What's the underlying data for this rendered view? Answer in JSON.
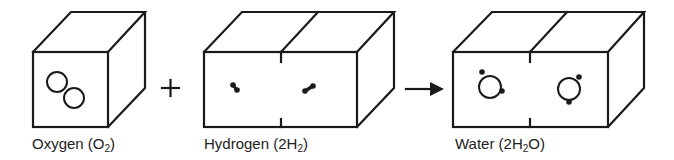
{
  "diagram": {
    "operators": {
      "plus": "+",
      "arrow": "→"
    },
    "boxes": [
      {
        "id": "oxygen",
        "label_main": "Oxygen (O",
        "label_sub": "2",
        "label_end": ")",
        "cells": 1,
        "molecule": "O2 - two overlapping oxygen atoms"
      },
      {
        "id": "hydrogen",
        "label_main": "Hydrogen (2H",
        "label_sub": "2",
        "label_end": ")",
        "cells": 2,
        "molecule": "H2 x2 - paired hydrogen dots"
      },
      {
        "id": "water",
        "label_main": "Water (2H",
        "label_sub": "2",
        "label_end": "O)",
        "cells": 2,
        "molecule": "H2O x2 - oxygen circle with two hydrogen dots"
      }
    ],
    "colors": {
      "line": "#1a1a1a",
      "background": "#ffffff",
      "text": "#222222"
    }
  }
}
